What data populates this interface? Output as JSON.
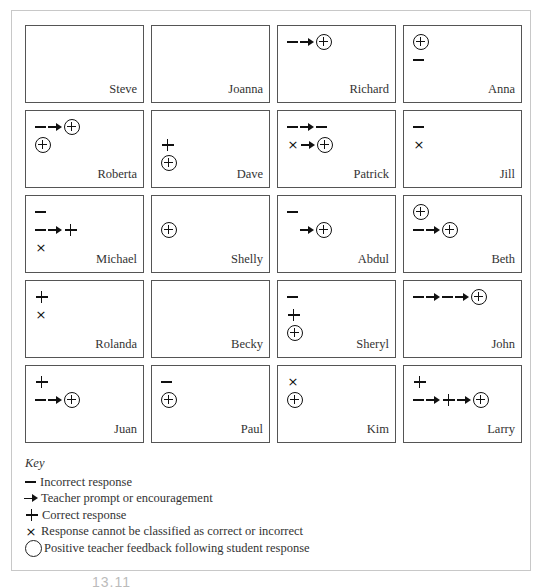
{
  "students": [
    {
      "name": "Steve",
      "lines": []
    },
    {
      "name": "Joanna",
      "lines": []
    },
    {
      "name": "Richard",
      "lines": [
        [
          "minus",
          "arrow",
          "circle-plus"
        ]
      ]
    },
    {
      "name": "Anna",
      "lines": [
        [
          "circle-plus"
        ],
        [
          "minus"
        ]
      ]
    },
    {
      "name": "Roberta",
      "lines": [
        [
          "minus",
          "arrow",
          "circle-plus"
        ],
        [
          "circle-plus"
        ]
      ]
    },
    {
      "name": "Dave",
      "lines": [
        [],
        [
          "plus"
        ],
        [
          "circle-plus"
        ]
      ]
    },
    {
      "name": "Patrick",
      "lines": [
        [
          "minus",
          "arrow",
          "minus"
        ],
        [
          "times",
          "arrow",
          "circle-plus"
        ]
      ]
    },
    {
      "name": "Jill",
      "lines": [
        [
          "minus"
        ],
        [
          "times"
        ]
      ]
    },
    {
      "name": "Michael",
      "lines": [
        [
          "minus"
        ],
        [
          "minus",
          "arrow",
          "plus"
        ],
        [
          "times"
        ]
      ]
    },
    {
      "name": "Shelly",
      "lines": [
        [],
        [
          "circle-plus"
        ]
      ]
    },
    {
      "name": "Abdul",
      "lines": [
        [
          "minus"
        ],
        [
          "blank",
          "arrow",
          "circle-plus"
        ]
      ]
    },
    {
      "name": "Beth",
      "lines": [
        [
          "circle-plus"
        ],
        [
          "minus",
          "arrow",
          "circle-plus"
        ]
      ]
    },
    {
      "name": "Rolanda",
      "lines": [
        [
          "plus"
        ],
        [
          "times"
        ]
      ]
    },
    {
      "name": "Becky",
      "lines": []
    },
    {
      "name": "Sheryl",
      "lines": [
        [
          "minus"
        ],
        [
          "plus"
        ],
        [
          "circle-plus"
        ]
      ]
    },
    {
      "name": "John",
      "lines": [
        [
          "minus",
          "arrow",
          "minus",
          "arrow",
          "circle-plus"
        ]
      ]
    },
    {
      "name": "Juan",
      "lines": [
        [
          "plus"
        ],
        [
          "minus",
          "arrow",
          "circle-plus"
        ]
      ]
    },
    {
      "name": "Paul",
      "lines": [
        [
          "minus"
        ],
        [
          "circle-plus"
        ]
      ]
    },
    {
      "name": "Kim",
      "lines": [
        [
          "times"
        ],
        [
          "circle-plus"
        ]
      ]
    },
    {
      "name": "Larry",
      "lines": [
        [
          "plus"
        ],
        [
          "minus",
          "arrow",
          "plus",
          "arrow",
          "circle-plus"
        ]
      ]
    }
  ],
  "key": {
    "title": "Key",
    "items": [
      {
        "symbol": "minus",
        "label": "Incorrect response"
      },
      {
        "symbol": "arrow",
        "label": "Teacher prompt or encouragement"
      },
      {
        "symbol": "plus",
        "label": "Correct response"
      },
      {
        "symbol": "times",
        "label": "Response cannot be classified as correct or incorrect"
      },
      {
        "symbol": "circle",
        "label": "Positive teacher feedback following student response"
      }
    ]
  },
  "figure_number": "13.11"
}
